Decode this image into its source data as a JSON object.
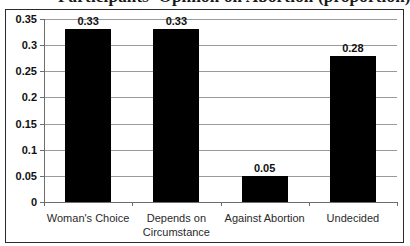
{
  "title_partial": "Participants' Opinion on Abortion (proportion)",
  "chart_data": {
    "type": "bar",
    "title": "",
    "xlabel": "",
    "ylabel": "",
    "categories": [
      "Woman's Choice",
      "Depends on Circumstance",
      "Against Abortion",
      "Undecided"
    ],
    "category_lines": [
      [
        "Woman's Choice"
      ],
      [
        "Depends on",
        "Circumstance"
      ],
      [
        "Against Abortion"
      ],
      [
        "Undecided"
      ]
    ],
    "values": [
      0.33,
      0.33,
      0.05,
      0.28
    ],
    "value_labels": [
      "0.33",
      "0.33",
      "0.05",
      "0.28"
    ],
    "ylim": [
      0,
      0.35
    ],
    "yticks": [
      0,
      0.05,
      0.1,
      0.15,
      0.2,
      0.25,
      0.3,
      0.35
    ],
    "ytick_labels": [
      "0",
      "0.05",
      "0.1",
      "0.15",
      "0.2",
      "0.25",
      "0.3",
      "0.35"
    ],
    "grid": true,
    "legend": false,
    "bar_color": "#000000",
    "grid_color": "#9a9a9a",
    "axis_color": "#6d6d6d",
    "frame_color": "#2b2b2b",
    "background": "#ffffff"
  }
}
